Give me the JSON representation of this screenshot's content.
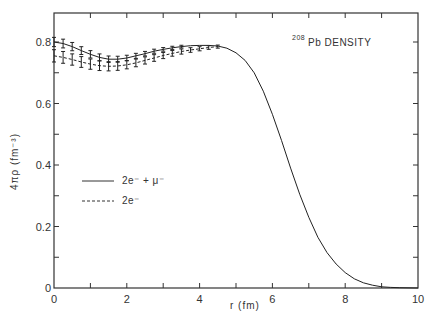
{
  "chart_data": {
    "type": "line",
    "title": "",
    "annotation": {
      "superscript": "208",
      "text": "Pb DENSITY"
    },
    "xlabel": "r (fm)",
    "ylabel": "4πρ (fm⁻³)",
    "xlim": [
      0,
      10
    ],
    "ylim": [
      0,
      0.88
    ],
    "x_ticks": [
      0,
      2,
      4,
      6,
      8,
      10
    ],
    "x_minor_ticks": [
      1,
      3,
      5,
      7,
      9
    ],
    "y_ticks": [
      0,
      0.2,
      0.4,
      0.6,
      0.8
    ],
    "y_tick_labels": [
      "0",
      "0.2",
      "0.4",
      "0.6",
      "0.8"
    ],
    "y_minor_ticks": [
      0.1,
      0.3,
      0.5,
      0.7
    ],
    "grid": false,
    "legend": {
      "position": "left-middle",
      "entries": [
        {
          "label": "2e⁻ + μ⁻",
          "style": "solid"
        },
        {
          "label": "2e⁻",
          "style": "dashed"
        }
      ]
    },
    "series": [
      {
        "name": "2e⁻ + μ⁻",
        "style": "solid",
        "x": [
          0,
          0.25,
          0.5,
          0.75,
          1.0,
          1.25,
          1.5,
          1.75,
          2.0,
          2.25,
          2.5,
          2.75,
          3.0,
          3.25,
          3.5,
          3.75,
          4.0,
          4.25,
          4.5,
          4.75,
          5.0,
          5.25,
          5.5,
          5.75,
          6.0,
          6.25,
          6.5,
          6.75,
          7.0,
          7.25,
          7.5,
          7.75,
          8.0,
          8.25,
          8.5,
          8.75,
          9.0,
          9.25,
          9.5,
          10.0
        ],
        "y": [
          0.8,
          0.795,
          0.785,
          0.772,
          0.76,
          0.75,
          0.744,
          0.744,
          0.748,
          0.755,
          0.762,
          0.77,
          0.776,
          0.781,
          0.785,
          0.788,
          0.789,
          0.789,
          0.787,
          0.78,
          0.765,
          0.74,
          0.7,
          0.64,
          0.565,
          0.48,
          0.39,
          0.305,
          0.23,
          0.165,
          0.115,
          0.078,
          0.05,
          0.03,
          0.017,
          0.009,
          0.004,
          0.002,
          0.001,
          0.0
        ],
        "error_bar_range": [
          0,
          3.7
        ],
        "error_bar_halfwidth_at_0": 0.015
      },
      {
        "name": "2e⁻",
        "style": "dashed",
        "x": [
          0,
          0.25,
          0.5,
          0.75,
          1.0,
          1.25,
          1.5,
          1.75,
          2.0,
          2.25,
          2.5,
          2.75,
          3.0,
          3.25,
          3.5,
          3.75,
          4.0,
          4.25,
          4.5
        ],
        "y": [
          0.755,
          0.75,
          0.743,
          0.735,
          0.728,
          0.723,
          0.721,
          0.722,
          0.726,
          0.732,
          0.74,
          0.748,
          0.756,
          0.763,
          0.769,
          0.774,
          0.778,
          0.782,
          0.785
        ],
        "error_bar_halfwidth_at_0": 0.02
      }
    ]
  }
}
